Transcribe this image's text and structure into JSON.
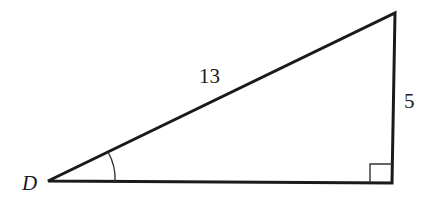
{
  "diagram": {
    "type": "right-triangle",
    "vertex_label": "D",
    "hypotenuse_label": "13",
    "opposite_side_label": "5",
    "angle_marked_at": "D",
    "right_angle_at": "bottom-right",
    "stroke_color": "#1a1a1a"
  }
}
